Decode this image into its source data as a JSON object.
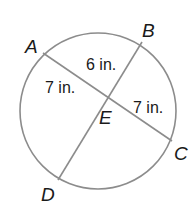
{
  "diagram": {
    "type": "circle-intersecting-chords",
    "colors": {
      "stroke": "#8c8c8c",
      "text": "#1a1a1a",
      "background": "#ffffff"
    },
    "circle": {
      "cx": 98,
      "cy": 111,
      "r": 78
    },
    "points": {
      "A": {
        "label": "A",
        "x": 43,
        "y": 53,
        "label_x": 25,
        "label_y": 53
      },
      "B": {
        "label": "B",
        "x": 142,
        "y": 42,
        "label_x": 142,
        "label_y": 37
      },
      "C": {
        "label": "C",
        "x": 172,
        "y": 141,
        "label_x": 174,
        "label_y": 160
      },
      "D": {
        "label": "D",
        "x": 58,
        "y": 180,
        "label_x": 41,
        "label_y": 201
      },
      "E": {
        "label": "E",
        "x": 107,
        "y": 99,
        "label_x": 99,
        "label_y": 124
      }
    },
    "chords": [
      {
        "name": "AC",
        "from": "A",
        "to": "C"
      },
      {
        "name": "BD",
        "from": "B",
        "to": "D"
      }
    ],
    "lengths": [
      {
        "segment": "EB",
        "label": "6 in.",
        "x": 86,
        "y": 70
      },
      {
        "segment": "AE",
        "label": "7 in.",
        "x": 45,
        "y": 93
      },
      {
        "segment": "EC",
        "label": "7 in.",
        "x": 133,
        "y": 113
      }
    ]
  }
}
